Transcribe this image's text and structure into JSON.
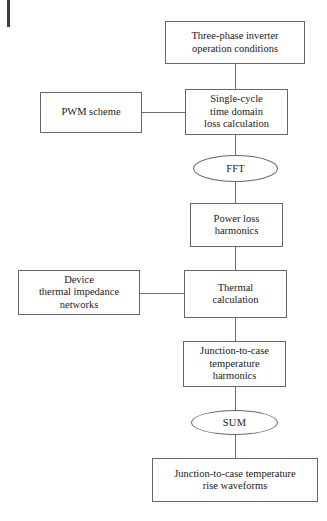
{
  "diagram": {
    "type": "flowchart",
    "orientation": "top-to-bottom",
    "background_color": "#ffffff",
    "line_color": "#6e6e6e",
    "border_color": "#666666",
    "text_color": "#1a1a1a",
    "nodes": [
      {
        "id": "inverter-conditions",
        "shape": "rectangle",
        "lines": [
          "Three-phase inverter",
          "operation conditions"
        ],
        "text": "Three-phase inverter operation conditions"
      },
      {
        "id": "pwm-scheme",
        "shape": "rectangle",
        "lines": [
          "PWM scheme"
        ],
        "text": "PWM scheme"
      },
      {
        "id": "single-cycle-loss",
        "shape": "rectangle",
        "lines": [
          "Single-cycle",
          "time domain",
          "loss calculation"
        ],
        "text": "Single-cycle time domain loss calculation"
      },
      {
        "id": "fft",
        "shape": "ellipse",
        "lines": [
          "FFT"
        ],
        "text": "FFT"
      },
      {
        "id": "power-loss-harmonics",
        "shape": "rectangle",
        "lines": [
          "Power loss",
          "harmonics"
        ],
        "text": "Power loss harmonics"
      },
      {
        "id": "thermal-impedance-networks",
        "shape": "rectangle",
        "lines": [
          "Device",
          "thermal impedance",
          "networks"
        ],
        "text": "Device thermal impedance networks"
      },
      {
        "id": "thermal-calculation",
        "shape": "rectangle",
        "lines": [
          "Thermal",
          "calculation"
        ],
        "text": "Thermal calculation"
      },
      {
        "id": "junction-case-harmonics",
        "shape": "rectangle",
        "lines": [
          "Junction-to-case",
          "temperature",
          "harmonics"
        ],
        "text": "Junction-to-case temperature harmonics"
      },
      {
        "id": "sum",
        "shape": "ellipse",
        "lines": [
          "SUM"
        ],
        "text": "SUM"
      },
      {
        "id": "junction-case-rise-waveforms",
        "shape": "rectangle",
        "lines": [
          "Junction-to-case temperature",
          "rise waveforms"
        ],
        "text": "Junction-to-case temperature rise waveforms"
      }
    ],
    "edges": [
      {
        "id": "edge-conditions-to-loss",
        "from": "inverter-conditions",
        "to": "single-cycle-loss",
        "direction": "vertical"
      },
      {
        "id": "edge-pwm-to-loss",
        "from": "pwm-scheme",
        "to": "single-cycle-loss",
        "direction": "horizontal"
      },
      {
        "id": "edge-loss-to-fft",
        "from": "single-cycle-loss",
        "to": "fft",
        "direction": "vertical"
      },
      {
        "id": "edge-fft-to-power-loss",
        "from": "fft",
        "to": "power-loss-harmonics",
        "direction": "vertical"
      },
      {
        "id": "edge-power-loss-to-thermal",
        "from": "power-loss-harmonics",
        "to": "thermal-calculation",
        "direction": "vertical"
      },
      {
        "id": "edge-networks-to-thermal",
        "from": "thermal-impedance-networks",
        "to": "thermal-calculation",
        "direction": "horizontal"
      },
      {
        "id": "edge-thermal-to-junction-harmonics",
        "from": "thermal-calculation",
        "to": "junction-case-harmonics",
        "direction": "vertical"
      },
      {
        "id": "edge-junction-harmonics-to-sum",
        "from": "junction-case-harmonics",
        "to": "sum",
        "direction": "vertical"
      },
      {
        "id": "edge-sum-to-rise-waveforms",
        "from": "sum",
        "to": "junction-case-rise-waveforms",
        "direction": "vertical"
      }
    ]
  }
}
